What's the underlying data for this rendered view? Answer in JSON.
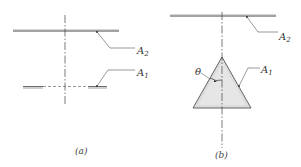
{
  "figure_a": {
    "caption": "(a)",
    "label_upper": "A",
    "label_upper_sub": "2",
    "label_lower": "A",
    "label_lower_sub": "1"
  },
  "figure_b": {
    "caption": "(b)",
    "label_upper": "A",
    "label_upper_sub": "2",
    "label_triangle": "A",
    "label_triangle_sub": "1",
    "angle_label": "θ"
  },
  "colors": {
    "plate_fill": "#d6d6d6",
    "line": "#444444",
    "triangle_fill": "#dcdcdc"
  }
}
